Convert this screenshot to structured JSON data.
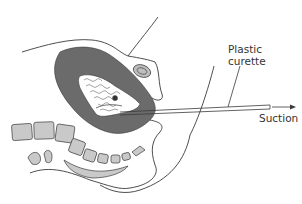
{
  "figure": {
    "type": "anatomical-diagram",
    "labels": {
      "plastic": "Plastic",
      "curette": "curette",
      "suction": "Suction"
    },
    "colors": {
      "line": "#3a3a3a",
      "uterine_wall": "#6b6b6b",
      "bone": "#c9c9c9",
      "bladder_fill": "#bdbdbd",
      "background": "#ffffff"
    }
  }
}
